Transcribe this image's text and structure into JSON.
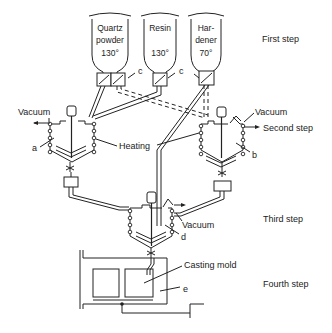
{
  "hoppers": [
    {
      "lines": [
        "Quartz",
        "powder",
        "130°"
      ]
    },
    {
      "lines": [
        "Resin",
        "",
        "130°"
      ]
    },
    {
      "lines": [
        "Har-",
        "dener",
        "70°"
      ]
    }
  ],
  "steps": {
    "first": "First step",
    "second": "Second step",
    "third": "Third step",
    "fourth": "Fourth step"
  },
  "labels": {
    "vacuum_left": "Vacuum",
    "vacuum_right": "Vacuum",
    "vacuum_center": "Vacuum",
    "heating": "Heating",
    "casting_mold": "Casting mold",
    "a": "a",
    "b": "b",
    "c1": "c",
    "c2": "c",
    "d": "d",
    "e": "e"
  }
}
